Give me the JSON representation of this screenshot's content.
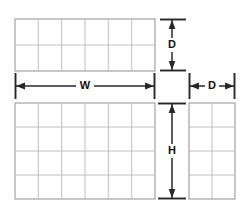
{
  "diagram": {
    "background_color": "#ffffff",
    "line_color": "#272727",
    "grid_line_color": "#b9b9b9",
    "grid_outline_color": "#9a9a9a",
    "views": [
      {
        "name": "top-view",
        "columns": 6,
        "rows": 2,
        "x": 15,
        "y": 19,
        "width": 140,
        "height": 52
      },
      {
        "name": "front-view",
        "columns": 6,
        "rows": 4,
        "x": 15,
        "y": 103,
        "width": 140,
        "height": 96
      },
      {
        "name": "side-view",
        "columns": 2,
        "rows": 4,
        "x": 189,
        "y": 103,
        "width": 46,
        "height": 96
      }
    ],
    "dimensions": [
      {
        "name": "depth-top",
        "label": "D",
        "orientation": "vertical",
        "label_x": 172,
        "label_y": 45
      },
      {
        "name": "width",
        "label": "W",
        "orientation": "horizontal",
        "label_x": 85,
        "label_y": 86
      },
      {
        "name": "depth-side",
        "label": "D",
        "orientation": "horizontal",
        "label_x": 212,
        "label_y": 86
      },
      {
        "name": "height",
        "label": "H",
        "orientation": "vertical",
        "label_x": 172,
        "label_y": 151
      }
    ]
  }
}
